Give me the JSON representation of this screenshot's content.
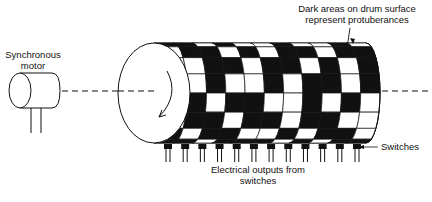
{
  "labels": {
    "motor_line1": "Synchronous",
    "motor_line2": "motor",
    "drum_note_line1": "Dark areas on drum surface",
    "drum_note_line2": "represent protuberances",
    "switches": "Switches",
    "outputs_line1": "Electrical outputs from",
    "outputs_line2": "switches"
  },
  "drum": {
    "rows": 8,
    "columns": 11,
    "pattern": [
      [
        1,
        1,
        0,
        1,
        0,
        0,
        1,
        0,
        0,
        1,
        0
      ],
      [
        0,
        1,
        1,
        0,
        1,
        0,
        1,
        1,
        0,
        1,
        1
      ],
      [
        0,
        0,
        1,
        1,
        0,
        1,
        1,
        0,
        1,
        0,
        1
      ],
      [
        1,
        0,
        1,
        0,
        0,
        1,
        0,
        1,
        1,
        0,
        1
      ],
      [
        1,
        1,
        0,
        1,
        1,
        0,
        0,
        1,
        0,
        1,
        0
      ],
      [
        0,
        1,
        1,
        0,
        1,
        1,
        0,
        1,
        1,
        0,
        0
      ],
      [
        1,
        0,
        1,
        1,
        0,
        0,
        1,
        0,
        1,
        1,
        0
      ],
      [
        1,
        1,
        0,
        1,
        1,
        1,
        0,
        1,
        0,
        1,
        1
      ]
    ]
  },
  "switch_count": 12,
  "colors": {
    "ink": "#111111",
    "paper": "#ffffff"
  }
}
